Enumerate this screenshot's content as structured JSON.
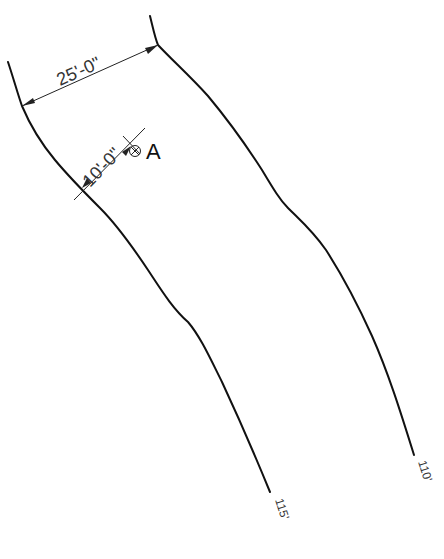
{
  "drawing": {
    "type": "road-plan-dimensioned-sketch",
    "dimensions": [
      {
        "id": "road-width",
        "label": "25'-0\""
      },
      {
        "id": "offset-to-a",
        "label": "10'-0\""
      }
    ],
    "point_label": "A",
    "point_symbol": "circle-x-icon",
    "edges": [
      {
        "id": "left-edge",
        "station_label": "115'"
      },
      {
        "id": "right-edge",
        "station_label": "110'"
      }
    ],
    "colors": {
      "line": "#111111",
      "dimension": "#222222",
      "background": "#ffffff"
    }
  }
}
